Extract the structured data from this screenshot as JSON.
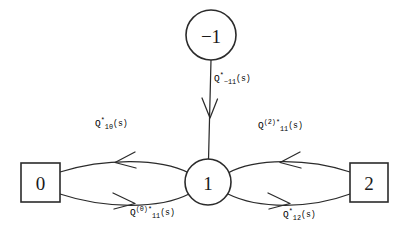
{
  "diagram": {
    "background_color": "#ffffff",
    "stroke_color": "#2b2b2b",
    "nodes": [
      {
        "id": "minus-one",
        "label": "−1",
        "shape": "circle",
        "cx": 211,
        "cy": 35,
        "r": 25
      },
      {
        "id": "one",
        "label": "1",
        "shape": "circle",
        "cx": 208,
        "cy": 182,
        "r": 23
      },
      {
        "id": "zero",
        "label": "0",
        "shape": "square",
        "x": 21,
        "y": 163,
        "w": 39,
        "h": 39
      },
      {
        "id": "two",
        "label": "2",
        "shape": "square",
        "x": 350,
        "y": 163,
        "w": 38,
        "h": 39
      }
    ],
    "edges": [
      {
        "id": "edge-minus1-to-1",
        "from": "minus-one",
        "to": "one",
        "direction": "down",
        "label_parts": {
          "base": "Q",
          "sup": "*",
          "sub": "−11",
          "arg": "(s)"
        },
        "label_plain": "Q*_-11(s)",
        "label_x": 214,
        "label_y": 80
      },
      {
        "id": "edge-1-to-0",
        "from": "one",
        "to": "zero",
        "direction": "left",
        "label_parts": {
          "base": "Q",
          "sup": "*",
          "sub": "10",
          "arg": "(s)"
        },
        "label_plain": "Q*_10(s)",
        "label_x": 95,
        "label_y": 125
      },
      {
        "id": "edge-0-to-1",
        "from": "zero",
        "to": "one",
        "direction": "right",
        "label_parts": {
          "base": "Q",
          "sup": "(0)*",
          "sub": "11",
          "arg": "(s)"
        },
        "label_plain": "Q^(0)*_11(s)",
        "label_x": 130,
        "label_y": 214
      },
      {
        "id": "edge-2-to-1",
        "from": "two",
        "to": "one",
        "direction": "left",
        "label_parts": {
          "base": "Q",
          "sup": "(2)*",
          "sub": "11",
          "arg": "(s)"
        },
        "label_plain": "Q^(2)*_11(s)",
        "label_x": 258,
        "label_y": 127
      },
      {
        "id": "edge-1-to-2",
        "from": "one",
        "to": "two",
        "direction": "right",
        "label_parts": {
          "base": "Q",
          "sup": "*",
          "sub": "12",
          "arg": "(s)"
        },
        "label_plain": "Q*_12(s)",
        "label_x": 283,
        "label_y": 216
      }
    ]
  }
}
